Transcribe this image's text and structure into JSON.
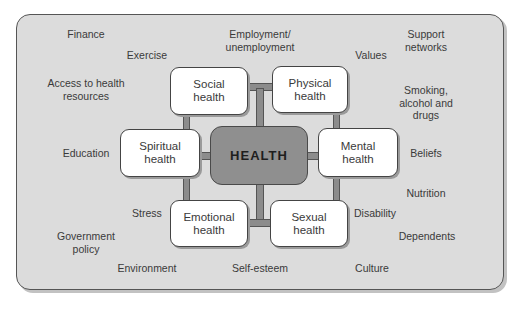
{
  "diagram": {
    "center": {
      "label": "HEALTH",
      "color": "#8f8f8f"
    },
    "dimensions": [
      {
        "id": "social",
        "label": "Social\nhealth"
      },
      {
        "id": "physical",
        "label": "Physical\nhealth"
      },
      {
        "id": "spiritual",
        "label": "Spiritual\nhealth"
      },
      {
        "id": "mental",
        "label": "Mental\nhealth"
      },
      {
        "id": "emotional",
        "label": "Emotional\nhealth"
      },
      {
        "id": "sexual",
        "label": "Sexual\nhealth"
      }
    ],
    "factors": [
      {
        "label": "Finance"
      },
      {
        "label": "Exercise"
      },
      {
        "label": "Employment/\nunemployment"
      },
      {
        "label": "Values"
      },
      {
        "label": "Support\nnetworks"
      },
      {
        "label": "Access to health\nresources"
      },
      {
        "label": "Smoking,\nalcohol and\ndrugs"
      },
      {
        "label": "Education"
      },
      {
        "label": "Beliefs"
      },
      {
        "label": "Nutrition"
      },
      {
        "label": "Stress"
      },
      {
        "label": "Disability"
      },
      {
        "label": "Government\npolicy"
      },
      {
        "label": "Dependents"
      },
      {
        "label": "Environment"
      },
      {
        "label": "Self-esteem"
      },
      {
        "label": "Culture"
      }
    ],
    "colors": {
      "panel": "#dcdcdc",
      "connector": "#8c8c8c",
      "box": "#ffffff"
    }
  }
}
